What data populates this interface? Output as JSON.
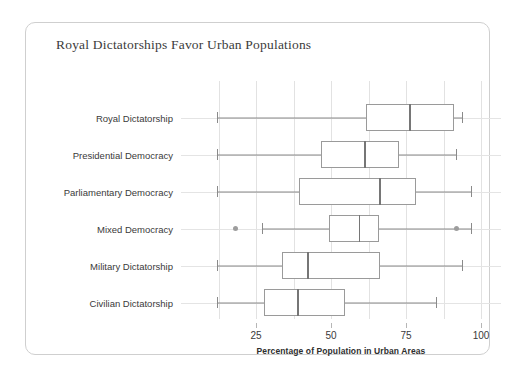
{
  "card": {
    "title": "Royal Dictatorships Favor Urban Populations"
  },
  "axis": {
    "x_title": "Percentage of Population in Urban Areas",
    "x_ticks": [
      {
        "value": 25,
        "label": "25"
      },
      {
        "value": 50,
        "label": "50"
      },
      {
        "value": 75,
        "label": "75"
      },
      {
        "value": 100,
        "label": "100"
      }
    ]
  },
  "colors": {
    "box_stroke": "#9a9a9a",
    "median": "#767676",
    "whisker": "#8a8a8a",
    "outlier": "#9d9d9d",
    "gridline": "#e2e2e2",
    "card_border": "#cfcfcf",
    "title_text": "#3b3b3b",
    "background": "#ffffff"
  },
  "chart_data": {
    "type": "box",
    "title": "Royal Dictatorships Favor Urban Populations",
    "xlabel": "Percentage of Population in Urban Areas",
    "ylabel": "",
    "xlim": [
      8,
      107
    ],
    "grid": true,
    "legend": "none",
    "orientation": "horizontal",
    "categories": [
      "Royal Dictatorship",
      "Presidential Democracy",
      "Parliamentary Democracy",
      "Mixed Democracy",
      "Military Dictatorship",
      "Civilian Dictatorship"
    ],
    "boxes": [
      {
        "category": "Royal Dictatorship",
        "min": 12,
        "q1": 61.7,
        "median": 76,
        "q3": 91,
        "max": 93.7,
        "outliers": []
      },
      {
        "category": "Presidential Democracy",
        "min": 12,
        "q1": 46.7,
        "median": 61,
        "q3": 72.7,
        "max": 91.7,
        "outliers": []
      },
      {
        "category": "Parliamentary Democracy",
        "min": 12,
        "q1": 39.3,
        "median": 66,
        "q3": 78.3,
        "max": 96.7,
        "outliers": []
      },
      {
        "category": "Mixed Democracy",
        "min": 27,
        "q1": 49.3,
        "median": 59.3,
        "q3": 66,
        "max": 96.7,
        "outliers": [
          18,
          91.7
        ]
      },
      {
        "category": "Military Dictatorship",
        "min": 12,
        "q1": 33.7,
        "median": 42,
        "q3": 66.3,
        "max": 93.7,
        "outliers": []
      },
      {
        "category": "Civilian Dictatorship",
        "min": 12,
        "q1": 27.7,
        "median": 38.7,
        "q3": 54.7,
        "max": 85,
        "outliers": []
      }
    ]
  }
}
